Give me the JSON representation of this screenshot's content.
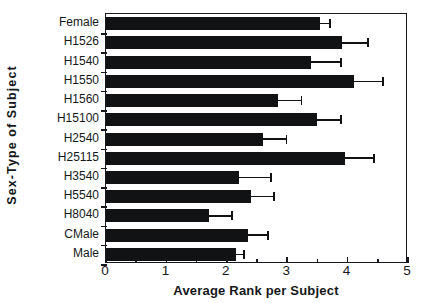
{
  "chart_data": {
    "type": "bar",
    "orientation": "horizontal",
    "title": "",
    "xlabel": "Average Rank  per Subject",
    "ylabel": "Sex-Type  of  Subject",
    "xlim": [
      0,
      5
    ],
    "xticks": [
      0,
      1,
      2,
      3,
      4,
      5
    ],
    "xticklabels": [
      "0",
      "1",
      "2",
      "3",
      "4",
      "5"
    ],
    "minor_xticks": [
      0.5,
      1.5,
      2.5,
      3.5,
      4.5
    ],
    "grid": false,
    "legend": null,
    "error_bars": "upper-only",
    "bar_color": "#111214",
    "categories": [
      "Female",
      "H1526",
      "H1540",
      "H1550",
      "H1560",
      "H15100",
      "H2540",
      "H25115",
      "H3540",
      "H5540",
      "H8040",
      "CMale",
      "Male"
    ],
    "values": [
      3.55,
      3.9,
      3.4,
      4.1,
      2.85,
      3.5,
      2.6,
      3.95,
      2.2,
      2.4,
      1.7,
      2.35,
      2.15
    ],
    "error_upper": [
      3.72,
      4.35,
      3.9,
      4.6,
      3.25,
      3.9,
      3.0,
      4.45,
      2.75,
      2.8,
      2.1,
      2.7,
      2.3
    ],
    "series": [
      {
        "name": "Average Rank",
        "values": [
          3.55,
          3.9,
          3.4,
          4.1,
          2.85,
          3.5,
          2.6,
          3.95,
          2.2,
          2.4,
          1.7,
          2.35,
          2.15
        ]
      }
    ]
  }
}
